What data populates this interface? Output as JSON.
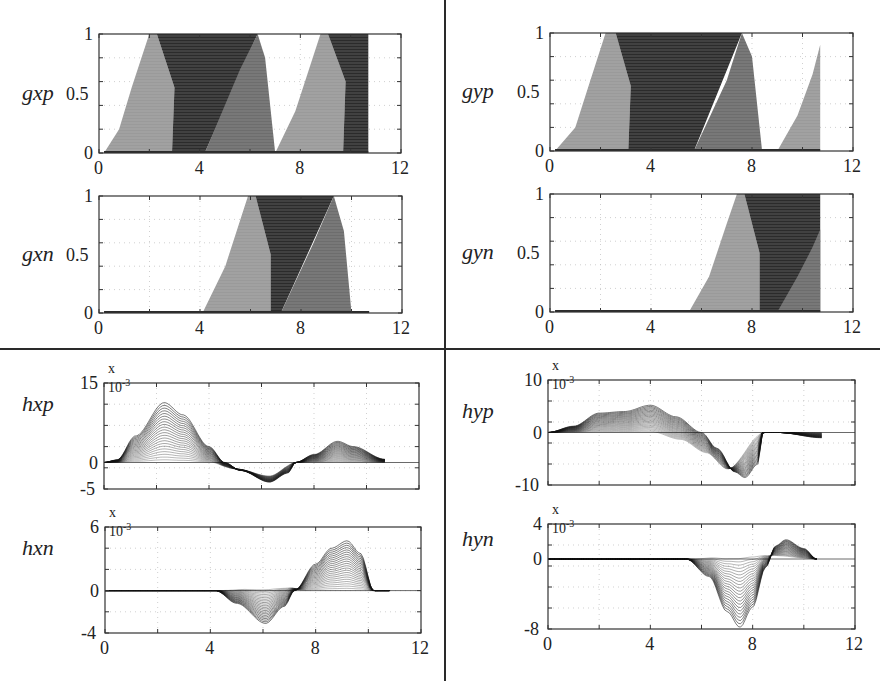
{
  "figure": {
    "dividers": {
      "vertical_x": 444,
      "horizontal_y": 349
    },
    "colors": {
      "axis": "#333333",
      "grid": "#bbbbbb",
      "band_light": "#9a9a9a",
      "band_mid": "#6e6e6e",
      "band_dark": "#2b2b2b",
      "line": "#111111"
    }
  },
  "chart_data": [
    {
      "id": "gxp",
      "type": "area",
      "ylabel": "gxp",
      "box": {
        "x": 99,
        "y": 34,
        "w": 302,
        "h": 119
      },
      "xlim": [
        0,
        12
      ],
      "ylim": [
        0,
        1
      ],
      "xticks": [
        "0",
        "4",
        "8",
        "12"
      ],
      "yticks": [
        "0",
        "0.5",
        "1"
      ],
      "exponent": "",
      "bands": [
        {
          "shade": "light",
          "points": [
            [
              0.2,
              0
            ],
            [
              0.8,
              0.2
            ],
            [
              1.3,
              0.55
            ],
            [
              2.0,
              1
            ],
            [
              2.3,
              1
            ],
            [
              3.0,
              0.55
            ],
            [
              2.9,
              0
            ]
          ]
        },
        {
          "shade": "dark",
          "points": [
            [
              2.3,
              1
            ],
            [
              6.3,
              1
            ],
            [
              4.2,
              0
            ],
            [
              2.9,
              0
            ],
            [
              3.0,
              0.55
            ]
          ]
        },
        {
          "shade": "mid",
          "points": [
            [
              4.2,
              0
            ],
            [
              5.6,
              0.7
            ],
            [
              6.3,
              1
            ],
            [
              6.6,
              0.8
            ],
            [
              7.0,
              0
            ]
          ]
        },
        {
          "shade": "light",
          "points": [
            [
              7.0,
              0
            ],
            [
              7.8,
              0.35
            ],
            [
              8.8,
              1
            ],
            [
              9.1,
              1
            ],
            [
              9.8,
              0.6
            ],
            [
              9.7,
              0
            ]
          ]
        },
        {
          "shade": "dark",
          "points": [
            [
              9.1,
              1
            ],
            [
              10.7,
              1
            ],
            [
              10.7,
              0
            ],
            [
              9.7,
              0
            ],
            [
              9.8,
              0.6
            ]
          ]
        }
      ]
    },
    {
      "id": "gyp",
      "type": "area",
      "ylabel": "gyp",
      "box": {
        "x": 550,
        "y": 33,
        "w": 303,
        "h": 118
      },
      "xlim": [
        0,
        12
      ],
      "ylim": [
        0,
        1
      ],
      "xticks": [
        "0",
        "4",
        "8",
        "12"
      ],
      "yticks": [
        "0",
        "0.5",
        "1"
      ],
      "exponent": "",
      "bands": [
        {
          "shade": "light",
          "points": [
            [
              0.2,
              0
            ],
            [
              1.0,
              0.2
            ],
            [
              1.6,
              0.6
            ],
            [
              2.2,
              1
            ],
            [
              2.6,
              1
            ],
            [
              3.2,
              0.55
            ],
            [
              3.1,
              0
            ]
          ]
        },
        {
          "shade": "dark",
          "points": [
            [
              2.6,
              1
            ],
            [
              7.6,
              1
            ],
            [
              5.7,
              0
            ],
            [
              3.1,
              0
            ],
            [
              3.2,
              0.55
            ]
          ]
        },
        {
          "shade": "mid",
          "points": [
            [
              5.7,
              0
            ],
            [
              7.0,
              0.6
            ],
            [
              7.6,
              1
            ],
            [
              8.0,
              0.8
            ],
            [
              8.4,
              0
            ]
          ]
        },
        {
          "shade": "light",
          "points": [
            [
              9.0,
              0
            ],
            [
              9.8,
              0.3
            ],
            [
              10.4,
              0.65
            ],
            [
              10.7,
              0.9
            ],
            [
              10.7,
              0
            ]
          ]
        }
      ]
    },
    {
      "id": "gxn",
      "type": "area",
      "ylabel": "gxn",
      "box": {
        "x": 99,
        "y": 196,
        "w": 303,
        "h": 117
      },
      "xlim": [
        0,
        12
      ],
      "ylim": [
        0,
        1
      ],
      "xticks": [
        "0",
        "4",
        "8",
        "12"
      ],
      "yticks": [
        "0",
        "0.5",
        "1"
      ],
      "exponent": "",
      "bands": [
        {
          "shade": "light",
          "points": [
            [
              4.1,
              0
            ],
            [
              5.0,
              0.4
            ],
            [
              5.6,
              0.8
            ],
            [
              5.9,
              1
            ],
            [
              6.2,
              1
            ],
            [
              6.8,
              0.5
            ],
            [
              6.8,
              0
            ]
          ]
        },
        {
          "shade": "dark",
          "points": [
            [
              6.2,
              1
            ],
            [
              9.3,
              1
            ],
            [
              7.2,
              0
            ],
            [
              6.8,
              0
            ],
            [
              6.8,
              0.5
            ]
          ]
        },
        {
          "shade": "mid",
          "points": [
            [
              7.2,
              0
            ],
            [
              8.5,
              0.6
            ],
            [
              9.3,
              1
            ],
            [
              9.7,
              0.7
            ],
            [
              10.0,
              0
            ]
          ]
        }
      ]
    },
    {
      "id": "gyn",
      "type": "area",
      "ylabel": "gyn",
      "box": {
        "x": 550,
        "y": 194,
        "w": 303,
        "h": 118
      },
      "xlim": [
        0,
        12
      ],
      "ylim": [
        0,
        1
      ],
      "xticks": [
        "0",
        "4",
        "8",
        "12"
      ],
      "yticks": [
        "0",
        "0.5",
        "1"
      ],
      "exponent": "",
      "bands": [
        {
          "shade": "light",
          "points": [
            [
              5.5,
              0
            ],
            [
              6.3,
              0.3
            ],
            [
              7.0,
              0.75
            ],
            [
              7.4,
              1
            ],
            [
              7.7,
              1
            ],
            [
              8.3,
              0.5
            ],
            [
              8.3,
              0
            ]
          ]
        },
        {
          "shade": "dark",
          "points": [
            [
              7.7,
              1
            ],
            [
              10.7,
              1
            ],
            [
              10.7,
              0
            ],
            [
              8.3,
              0
            ],
            [
              8.3,
              0.5
            ]
          ]
        },
        {
          "shade": "mid",
          "points": [
            [
              9.0,
              0
            ],
            [
              9.8,
              0.3
            ],
            [
              10.4,
              0.55
            ],
            [
              10.7,
              0.7
            ],
            [
              10.7,
              0
            ]
          ]
        }
      ]
    },
    {
      "id": "hxp",
      "type": "line",
      "ylabel": "hxp",
      "box": {
        "x": 104,
        "y": 383,
        "w": 315,
        "h": 106
      },
      "xlim": [
        0,
        12
      ],
      "ylim": [
        -5,
        15
      ],
      "xticks": [],
      "yticks": [
        "-5",
        "0",
        "15"
      ],
      "ytick_values": [
        -5,
        0,
        15
      ],
      "exponent": "x 10-3",
      "families": [
        {
          "count": 22,
          "envelope": [
            [
              0,
              0
            ],
            [
              0.5,
              0.5
            ],
            [
              1.2,
              5
            ],
            [
              2.3,
              11.3
            ],
            [
              3.0,
              9
            ],
            [
              4.0,
              3
            ],
            [
              4.6,
              0
            ],
            [
              5.2,
              -1.5
            ],
            [
              6.3,
              -3.7
            ],
            [
              7.0,
              -2
            ],
            [
              7.3,
              0
            ],
            [
              8.0,
              1.5
            ],
            [
              8.9,
              4
            ],
            [
              9.5,
              3
            ],
            [
              10.7,
              0.6
            ]
          ],
          "base": [
            [
              0,
              0
            ],
            [
              4.0,
              0
            ],
            [
              5.0,
              -1.2
            ],
            [
              6.3,
              -2.5
            ],
            [
              7.3,
              0
            ],
            [
              10.7,
              0
            ]
          ]
        }
      ]
    },
    {
      "id": "hyp",
      "type": "line",
      "ylabel": "hyp",
      "box": {
        "x": 548,
        "y": 380,
        "w": 307,
        "h": 105
      },
      "xlim": [
        0,
        12
      ],
      "ylim": [
        -10,
        10
      ],
      "xticks": [],
      "yticks": [
        "-10",
        "0",
        "10"
      ],
      "ytick_values": [
        -10,
        0,
        10
      ],
      "exponent": "x 10-3",
      "families": [
        {
          "count": 22,
          "envelope": [
            [
              0,
              0
            ],
            [
              1.0,
              1.2
            ],
            [
              2.0,
              3.7
            ],
            [
              3.0,
              4.0
            ],
            [
              4.0,
              5.2
            ],
            [
              5.0,
              3
            ],
            [
              6.0,
              0
            ],
            [
              6.6,
              -3
            ],
            [
              7.3,
              -7.5
            ],
            [
              7.7,
              -8.6
            ],
            [
              8.2,
              -6
            ],
            [
              8.4,
              0
            ],
            [
              9.0,
              0
            ],
            [
              10.7,
              -1
            ]
          ],
          "base": [
            [
              0,
              0
            ],
            [
              4.0,
              0
            ],
            [
              5.2,
              -1.5
            ],
            [
              6.2,
              -4
            ],
            [
              7.0,
              -7
            ],
            [
              8.4,
              0
            ],
            [
              10.7,
              0
            ]
          ]
        }
      ]
    },
    {
      "id": "hxn",
      "type": "line",
      "ylabel": "hxn",
      "box": {
        "x": 105,
        "y": 527,
        "w": 316,
        "h": 106
      },
      "xlim": [
        0,
        12
      ],
      "ylim": [
        -4,
        6
      ],
      "xticks": [
        "0",
        "4",
        "8",
        "12"
      ],
      "yticks": [
        "-4",
        "0",
        "6"
      ],
      "ytick_values": [
        -4,
        0,
        6
      ],
      "exponent": "x 10-3",
      "families": [
        {
          "count": 22,
          "envelope": [
            [
              0,
              0
            ],
            [
              4.2,
              0
            ],
            [
              5.0,
              -1.2
            ],
            [
              6.1,
              -3.1
            ],
            [
              6.8,
              -1.5
            ],
            [
              7.2,
              0
            ],
            [
              8.0,
              2.5
            ],
            [
              8.6,
              4.0
            ],
            [
              9.2,
              4.7
            ],
            [
              9.7,
              3.5
            ],
            [
              10.2,
              0
            ],
            [
              10.8,
              0
            ]
          ],
          "base": [
            [
              0,
              0
            ],
            [
              4.2,
              0
            ],
            [
              5.5,
              0.2
            ],
            [
              7.0,
              0.3
            ],
            [
              7.6,
              0
            ],
            [
              10.8,
              0
            ]
          ]
        }
      ]
    },
    {
      "id": "hyn",
      "type": "line",
      "ylabel": "hyn",
      "box": {
        "x": 548,
        "y": 524,
        "w": 307,
        "h": 105
      },
      "xlim": [
        0,
        12
      ],
      "ylim": [
        -8,
        4
      ],
      "xticks": [
        "0",
        "4",
        "8",
        "12"
      ],
      "yticks": [
        "-8",
        "0",
        "4"
      ],
      "ytick_values": [
        -8,
        0,
        4
      ],
      "exponent": "x 10-3",
      "families": [
        {
          "count": 22,
          "envelope": [
            [
              0,
              0
            ],
            [
              5.4,
              0
            ],
            [
              6.3,
              -2
            ],
            [
              7.0,
              -6
            ],
            [
              7.5,
              -7.8
            ],
            [
              8.0,
              -5.5
            ],
            [
              8.5,
              -1
            ],
            [
              8.9,
              1.5
            ],
            [
              9.3,
              2.2
            ],
            [
              10.0,
              1.2
            ],
            [
              10.5,
              0
            ]
          ],
          "base": [
            [
              0,
              0
            ],
            [
              5.4,
              0
            ],
            [
              6.8,
              0.3
            ],
            [
              8.0,
              0.5
            ],
            [
              10.5,
              0
            ]
          ]
        }
      ]
    }
  ]
}
